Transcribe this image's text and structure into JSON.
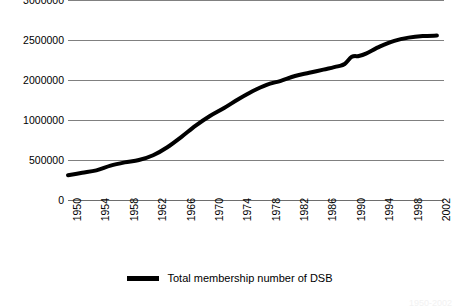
{
  "chart_data": {
    "type": "line",
    "title": "",
    "subtitle": "",
    "xlabel": "",
    "ylabel": "",
    "grid": true,
    "legend_position": "bottom-center",
    "xlim": [
      1950,
      2003
    ],
    "ylim": [
      0,
      3000000
    ],
    "y_ticks": [
      0,
      500000,
      1000000,
      2000000,
      2500000,
      3000000
    ],
    "y_tick_labels": [
      "0",
      "500000",
      "1000000",
      "2000000",
      "2500000",
      "3000000"
    ],
    "x_ticks": [
      1950,
      1954,
      1958,
      1962,
      1966,
      1970,
      1974,
      1978,
      1982,
      1986,
      1990,
      1994,
      1998,
      2002
    ],
    "x_tick_labels": [
      "1950",
      "1954",
      "1958",
      "1962",
      "1966",
      "1970",
      "1974",
      "1978",
      "1982",
      "1986",
      "1990",
      "1994",
      "1998",
      "2002"
    ],
    "series": [
      {
        "name": "Total membership number of DSB",
        "color": "#000000",
        "line_width": 4,
        "x": [
          1950,
          1952,
          1954,
          1956,
          1958,
          1960,
          1962,
          1964,
          1966,
          1968,
          1970,
          1972,
          1974,
          1976,
          1978,
          1980,
          1982,
          1984,
          1986,
          1988,
          1989,
          1990,
          1991,
          1992,
          1994,
          1996,
          1998,
          2000,
          2002
        ],
        "values": [
          310000,
          340000,
          370000,
          430000,
          470000,
          500000,
          560000,
          660000,
          790000,
          930000,
          1100000,
          1300000,
          1520000,
          1720000,
          1880000,
          1980000,
          2050000,
          2090000,
          2130000,
          2170000,
          2200000,
          2290000,
          2300000,
          2330000,
          2420000,
          2490000,
          2530000,
          2550000,
          2555000
        ]
      }
    ]
  },
  "legend": {
    "items": [
      {
        "label": "Total membership number of DSB",
        "color": "#000000"
      }
    ]
  },
  "bottom_caption": {
    "text": "1950-2002"
  }
}
